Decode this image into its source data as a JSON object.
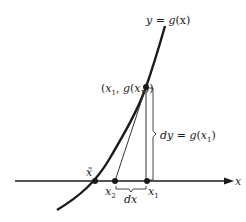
{
  "figure": {
    "curve_label": "y = g(x)",
    "curve_label_parts": {
      "lhs": "y",
      "eq": " = ",
      "fn": "g",
      "arg": "(x)"
    },
    "point_label": "(x1, g(x1))",
    "dy_label": "dy = g(x1)",
    "dx_label": "dx",
    "axis_label": "x",
    "root_label": "x̃",
    "x1_label": "x1",
    "x2_label": "x2",
    "subscript_1": "1",
    "subscript_2": "2",
    "colors": {
      "ink": "#1a1a1a",
      "background": "#ffffff",
      "thin_line": "#333333"
    }
  }
}
